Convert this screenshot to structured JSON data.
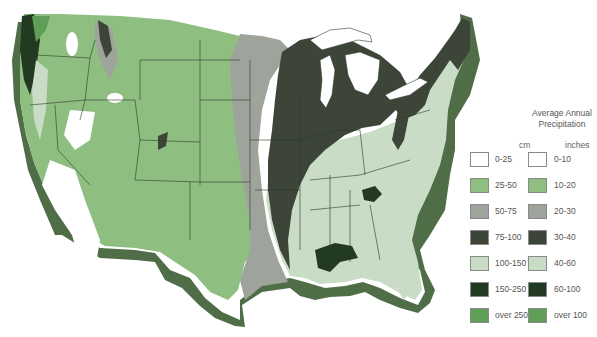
{
  "legend": {
    "title_line1": "Average Annual",
    "title_line2": "Precipitation",
    "cm_header": "cm",
    "inches_header": "inches",
    "items": [
      {
        "cm": "0-25",
        "inches": "0-10",
        "color": "#ffffff"
      },
      {
        "cm": "25-50",
        "inches": "10-20",
        "color": "#8fbf80"
      },
      {
        "cm": "50-75",
        "inches": "20-30",
        "color": "#9ea39c"
      },
      {
        "cm": "75-100",
        "inches": "30-40",
        "color": "#3c4538"
      },
      {
        "cm": "100-150",
        "inches": "40-60",
        "color": "#c8dcc6"
      },
      {
        "cm": "150-250",
        "inches": "60-100",
        "color": "#233a22"
      },
      {
        "cm": "over 250",
        "inches": "over 100",
        "color": "#5e9e56"
      }
    ]
  },
  "colors": {
    "state_border": "#2d3a2a",
    "coast_shadow": "#4f6e48",
    "lakes": "#ffffff"
  }
}
